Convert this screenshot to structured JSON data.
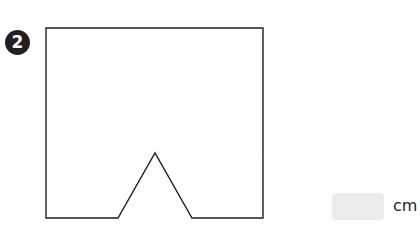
{
  "problem": {
    "number": "2",
    "unit_label": "cm",
    "answer_value": "",
    "answer_placeholder": ""
  },
  "figure": {
    "shape": "square-with-triangular-notch",
    "stroke_color": "#231f20",
    "outline_points": [
      [
        46,
        28
      ],
      [
        263,
        28
      ],
      [
        263,
        218
      ],
      [
        192,
        218
      ],
      [
        155,
        153
      ],
      [
        118,
        218
      ],
      [
        46,
        218
      ]
    ]
  },
  "colors": {
    "badge_bg": "#231f20",
    "badge_fg": "#ffffff",
    "answer_box_bg": "#ececec"
  }
}
